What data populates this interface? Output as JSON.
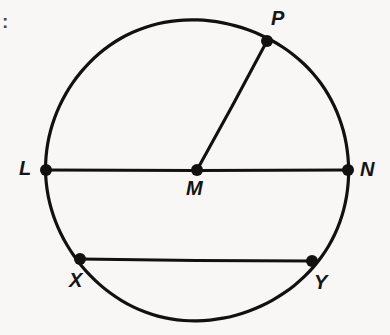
{
  "figure": {
    "kind": "circle-geometry-diagram",
    "background_color": "#f8f7f5",
    "stroke_color": "#111111",
    "canvas": {
      "width": 390,
      "height": 335
    },
    "list_marker": ":",
    "circle": {
      "center_label": "M",
      "center": {
        "x": 197,
        "y": 170
      },
      "radius": 151,
      "stroke_width": 3.2
    },
    "points": [
      {
        "id": "point-p",
        "label": "P",
        "x": 267,
        "y": 41,
        "label_x": 271,
        "label_y": 8
      },
      {
        "id": "point-l",
        "label": "L",
        "x": 46,
        "y": 170,
        "label_x": 19,
        "label_y": 158
      },
      {
        "id": "point-m",
        "label": "M",
        "x": 197,
        "y": 170,
        "label_x": 186,
        "label_y": 178
      },
      {
        "id": "point-n",
        "label": "N",
        "x": 348,
        "y": 170,
        "label_x": 360,
        "label_y": 159
      },
      {
        "id": "point-x",
        "label": "X",
        "x": 80,
        "y": 259,
        "label_x": 69,
        "label_y": 270
      },
      {
        "id": "point-y",
        "label": "Y",
        "x": 312,
        "y": 261,
        "label_x": 314,
        "label_y": 272
      }
    ],
    "segments": [
      {
        "id": "diameter-ln",
        "name": "LN",
        "from": "L",
        "to": "N",
        "x1": 46,
        "y1": 170,
        "x2": 348,
        "y2": 170,
        "role": "diameter"
      },
      {
        "id": "radius-mp",
        "name": "MP",
        "from": "M",
        "to": "P",
        "x1": 197,
        "y1": 170,
        "x2": 267,
        "y2": 41,
        "role": "radius"
      },
      {
        "id": "chord-xy",
        "name": "XY",
        "from": "X",
        "to": "Y",
        "x1": 80,
        "y1": 259,
        "x2": 312,
        "y2": 261,
        "role": "chord"
      }
    ],
    "dot_radius": 6
  },
  "chart_data": {
    "type": "diagram",
    "title": "",
    "elements": {
      "circle_center": "M",
      "diameter": "LN",
      "radius": "MP",
      "chord": "XY",
      "labeled_points": [
        "P",
        "L",
        "M",
        "N",
        "X",
        "Y"
      ]
    }
  }
}
